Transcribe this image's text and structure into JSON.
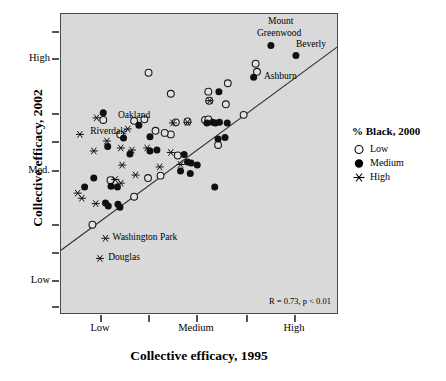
{
  "chart_data": {
    "type": "scatter",
    "title": "",
    "xlabel": "Collective efficacy, 1995",
    "ylabel": "Collective efficacy, 2002",
    "x_ticklabels": [
      "Low",
      "Medium",
      "High"
    ],
    "y_ticklabels": [
      "High",
      "Med.",
      "Low"
    ],
    "xlim": [
      0,
      1
    ],
    "ylim": [
      0,
      1
    ],
    "grid": false,
    "annotation": "R = 0.73, p < 0.01",
    "regression_line": {
      "x0": 0.0,
      "y0": 0.215,
      "x1": 1.0,
      "y1": 0.895
    },
    "legend": {
      "position": "right",
      "title": "% Black, 2000",
      "entries": [
        {
          "label": "Low",
          "marker": "open-circle"
        },
        {
          "label": "Medium",
          "marker": "filled-circle"
        },
        {
          "label": "High",
          "marker": "star"
        }
      ]
    },
    "series": [
      {
        "name": "Low",
        "marker": "open-circle",
        "points": [
          [
            0.315,
            0.805
          ],
          [
            0.395,
            0.735
          ],
          [
            0.53,
            0.742
          ],
          [
            0.533,
            0.712
          ],
          [
            0.6,
            0.77
          ],
          [
            0.593,
            0.7
          ],
          [
            0.657,
            0.665
          ],
          [
            0.7,
            0.835
          ],
          [
            0.705,
            0.808
          ],
          [
            0.263,
            0.645
          ],
          [
            0.3,
            0.65
          ],
          [
            0.413,
            0.64
          ],
          [
            0.455,
            0.643
          ],
          [
            0.518,
            0.648
          ],
          [
            0.53,
            0.65
          ],
          [
            0.152,
            0.648
          ],
          [
            0.213,
            0.6
          ],
          [
            0.34,
            0.612
          ],
          [
            0.395,
            0.6
          ],
          [
            0.373,
            0.605
          ],
          [
            0.565,
            0.565
          ],
          [
            0.42,
            0.53
          ],
          [
            0.358,
            0.463
          ],
          [
            0.313,
            0.455
          ],
          [
            0.178,
            0.448
          ],
          [
            0.263,
            0.393
          ],
          [
            0.113,
            0.3
          ]
        ]
      },
      {
        "name": "Medium",
        "marker": "filled-circle",
        "points": [
          [
            0.755,
            0.895
          ],
          [
            0.845,
            0.862
          ],
          [
            0.693,
            0.79
          ],
          [
            0.568,
            0.742
          ],
          [
            0.152,
            0.672
          ],
          [
            0.28,
            0.63
          ],
          [
            0.32,
            0.592
          ],
          [
            0.57,
            0.64
          ],
          [
            0.545,
            0.64
          ],
          [
            0.555,
            0.638
          ],
          [
            0.525,
            0.638
          ],
          [
            0.598,
            0.638
          ],
          [
            0.59,
            0.59
          ],
          [
            0.565,
            0.585
          ],
          [
            0.225,
            0.588
          ],
          [
            0.32,
            0.545
          ],
          [
            0.345,
            0.548
          ],
          [
            0.168,
            0.56
          ],
          [
            0.248,
            0.535
          ],
          [
            0.443,
            0.533
          ],
          [
            0.455,
            0.508
          ],
          [
            0.468,
            0.505
          ],
          [
            0.49,
            0.498
          ],
          [
            0.43,
            0.478
          ],
          [
            0.465,
            0.47
          ],
          [
            0.118,
            0.455
          ],
          [
            0.085,
            0.425
          ],
          [
            0.18,
            0.428
          ],
          [
            0.203,
            0.425
          ],
          [
            0.553,
            0.425
          ],
          [
            0.16,
            0.372
          ],
          [
            0.17,
            0.362
          ],
          [
            0.205,
            0.368
          ],
          [
            0.212,
            0.358
          ]
        ]
      },
      {
        "name": "High",
        "marker": "star",
        "points": [
          [
            0.535,
            0.712
          ],
          [
            0.455,
            0.64
          ],
          [
            0.403,
            0.638
          ],
          [
            0.128,
            0.655
          ],
          [
            0.24,
            0.618
          ],
          [
            0.068,
            0.6
          ],
          [
            0.165,
            0.578
          ],
          [
            0.118,
            0.545
          ],
          [
            0.215,
            0.555
          ],
          [
            0.255,
            0.548
          ],
          [
            0.31,
            0.555
          ],
          [
            0.395,
            0.54
          ],
          [
            0.22,
            0.498
          ],
          [
            0.355,
            0.492
          ],
          [
            0.43,
            0.5
          ],
          [
            0.268,
            0.465
          ],
          [
            0.195,
            0.45
          ],
          [
            0.215,
            0.438
          ],
          [
            0.06,
            0.405
          ],
          [
            0.075,
            0.388
          ],
          [
            0.125,
            0.37
          ],
          [
            0.16,
            0.255
          ],
          [
            0.14,
            0.188
          ]
        ]
      }
    ],
    "point_labels": [
      {
        "text": "Mount",
        "x": 0.745,
        "y": 0.975
      },
      {
        "text": "Greenwood",
        "x": 0.705,
        "y": 0.935
      },
      {
        "text": "Beverly",
        "x": 0.845,
        "y": 0.898
      },
      {
        "text": "Ashburn",
        "x": 0.73,
        "y": 0.792
      },
      {
        "text": "Oakland",
        "x": 0.205,
        "y": 0.66
      },
      {
        "text": "Riverdale",
        "x": 0.105,
        "y": 0.608
      },
      {
        "text": "Washington Park",
        "x": 0.185,
        "y": 0.255
      },
      {
        "text": "Douglas",
        "x": 0.17,
        "y": 0.188
      }
    ]
  }
}
